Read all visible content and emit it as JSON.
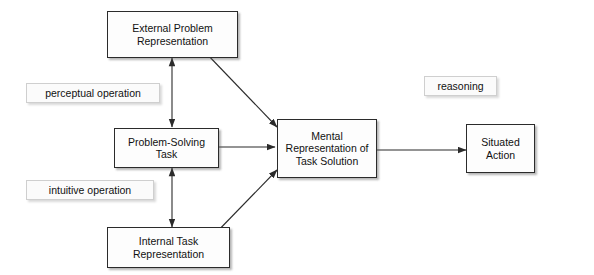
{
  "diagram": {
    "nodes": [
      {
        "id": "external",
        "text": "External Problem Representation"
      },
      {
        "id": "task",
        "text": "Problem-Solving Task"
      },
      {
        "id": "internal",
        "text": "Internal Task Representation"
      },
      {
        "id": "mental",
        "text": "Mental Representation of Task Solution"
      },
      {
        "id": "situated",
        "text": "Situated Action"
      }
    ],
    "labels": [
      {
        "id": "perceptual",
        "text": "perceptual operation"
      },
      {
        "id": "intuitive",
        "text": "intuitive operation"
      },
      {
        "id": "reasoning",
        "text": "reasoning"
      }
    ],
    "edges": [
      {
        "from": "external",
        "to": "task",
        "style": "double-arrow-vertical"
      },
      {
        "from": "task",
        "to": "internal",
        "style": "double-arrow-vertical"
      },
      {
        "from": "external",
        "to": "mental",
        "style": "arrow"
      },
      {
        "from": "task",
        "to": "mental",
        "style": "arrow"
      },
      {
        "from": "internal",
        "to": "mental",
        "style": "arrow"
      },
      {
        "from": "mental",
        "to": "situated",
        "style": "arrow"
      }
    ],
    "colors": {
      "stroke": "#2b2b2b",
      "node_fill": "#fdfdfd",
      "label_border": "#cfcfcf",
      "background": "#ffffff"
    }
  }
}
